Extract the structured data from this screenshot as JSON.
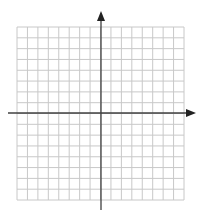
{
  "diagram": {
    "type": "coordinate-plane",
    "grid": {
      "columns": 16,
      "rows": 16,
      "left": 17,
      "top": 27,
      "right": 184,
      "bottom": 200,
      "line_color": "#c8c8c8"
    },
    "axes": {
      "color": "#404040",
      "x_axis": {
        "y": 113,
        "x_start": 8,
        "x_end": 196,
        "arrow": "right"
      },
      "y_axis": {
        "x": 101,
        "y_start": 11,
        "y_end": 210,
        "arrow": "up"
      }
    },
    "background": "#ffffff"
  }
}
